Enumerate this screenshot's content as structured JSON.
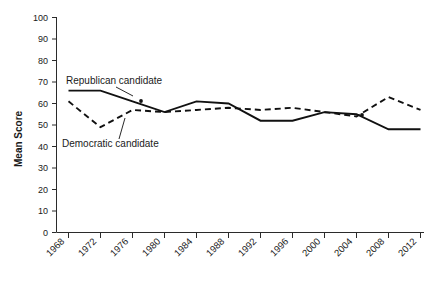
{
  "chart_data": {
    "type": "line",
    "title": "",
    "xlabel": "",
    "ylabel": "Mean Score",
    "ylim": [
      0,
      100
    ],
    "ytick_step": 10,
    "grid": false,
    "legend_position": "inline-annotation",
    "categories": [
      "1968",
      "1972",
      "1976",
      "1980",
      "1984",
      "1988",
      "1992",
      "1996",
      "2000",
      "2004",
      "2008",
      "2012"
    ],
    "yticks": [
      "0",
      "10",
      "20",
      "30",
      "40",
      "50",
      "60",
      "70",
      "80",
      "90",
      "100"
    ],
    "series": [
      {
        "name": "Republican candidate",
        "style": "solid",
        "values": [
          66,
          66,
          61,
          56,
          61,
          60,
          52,
          52,
          56,
          55,
          48,
          48
        ]
      },
      {
        "name": "Democratic candidate",
        "style": "dashed",
        "values": [
          61,
          49,
          57,
          56,
          57,
          58,
          57,
          58,
          56,
          54,
          63,
          57
        ]
      }
    ],
    "annotations": [
      {
        "text": "Republican candidate",
        "target_series": "Republican candidate"
      },
      {
        "text": "Democratic candidate",
        "target_series": "Democratic candidate"
      }
    ]
  },
  "axis": {
    "y_title": "Mean Score"
  },
  "labels": {
    "republican": "Republican candidate",
    "democratic": "Democratic candidate"
  },
  "colors": {
    "line": "#111111",
    "axis": "#2b2b2b",
    "background": "#ffffff"
  }
}
